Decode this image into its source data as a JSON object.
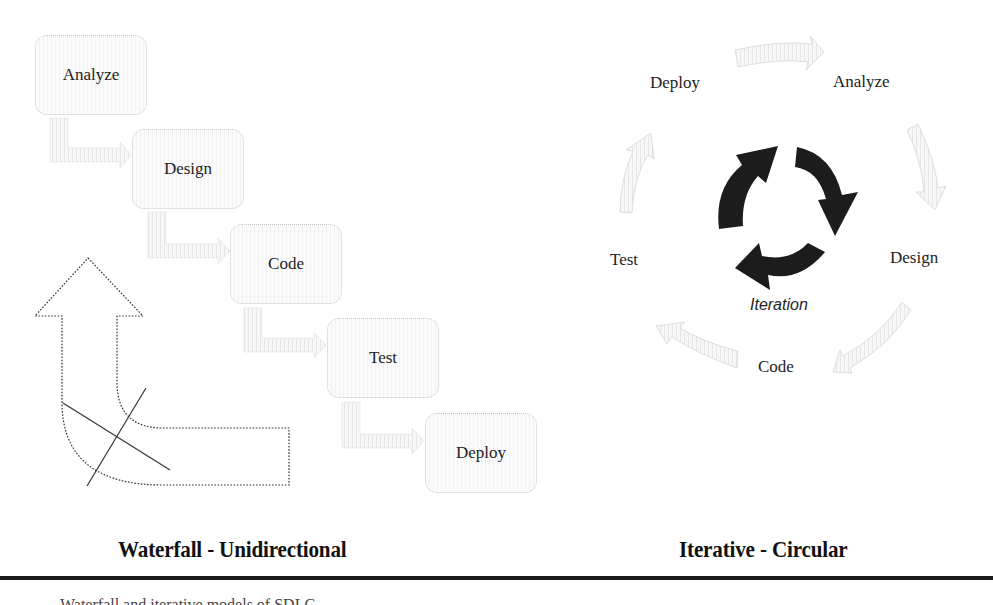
{
  "waterfall": {
    "title": "Waterfall - Unidirectional",
    "steps": [
      {
        "label": "Analyze"
      },
      {
        "label": "Design"
      },
      {
        "label": "Code"
      },
      {
        "label": "Test"
      },
      {
        "label": "Deploy"
      }
    ],
    "connector_icon": "step-down-arrow-icon",
    "back_arrow_icon": "crossed-out-return-arrow-icon"
  },
  "iterative": {
    "title": "Iterative - Circular",
    "center_label": "Iteration",
    "center_icon": "cycle-arrows-icon",
    "steps": [
      {
        "label": "Analyze"
      },
      {
        "label": "Design"
      },
      {
        "label": "Code"
      },
      {
        "label": "Test"
      },
      {
        "label": "Deploy"
      }
    ]
  },
  "footer": {
    "caption_partial": "Waterfall and iterative models of SDLC"
  }
}
